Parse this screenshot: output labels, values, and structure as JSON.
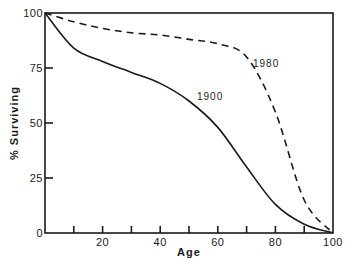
{
  "chart_data": {
    "type": "line",
    "title": "",
    "xlabel": "Age",
    "ylabel": "% Surviving",
    "xlim": [
      0,
      100
    ],
    "ylim": [
      0,
      100
    ],
    "x_tick_labels": [
      "20",
      "40",
      "60",
      "80",
      "100"
    ],
    "x_minor_ticks": [
      10,
      30,
      50,
      70,
      90
    ],
    "y_tick_labels": [
      "0",
      "25",
      "50",
      "75",
      "100"
    ],
    "grid": false,
    "legend": "inline labels",
    "x": [
      0,
      10,
      20,
      30,
      40,
      50,
      60,
      70,
      80,
      90,
      100
    ],
    "series": [
      {
        "name": "1900",
        "style": "solid",
        "values": [
          100,
          84,
          78,
          73,
          68,
          60,
          48,
          30,
          13,
          4,
          0
        ]
      },
      {
        "name": "1980",
        "style": "dashed",
        "values": [
          100,
          96,
          93,
          91,
          90,
          88,
          86,
          80,
          55,
          15,
          0
        ]
      }
    ],
    "annotations": [
      {
        "text": "1900",
        "x": 63,
        "y": 69
      },
      {
        "text": "1980",
        "x": 80,
        "y": 81
      }
    ]
  }
}
